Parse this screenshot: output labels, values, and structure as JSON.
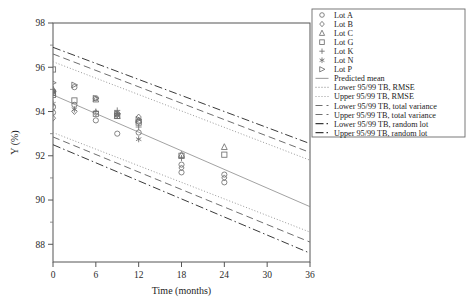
{
  "chart_data": {
    "type": "scatter",
    "title": "",
    "xlabel": "Time (months)",
    "ylabel": "Y (%)",
    "xlim": [
      0,
      36
    ],
    "ylim": [
      87.2,
      98
    ],
    "xticks": [
      0,
      6,
      12,
      18,
      24,
      30,
      36
    ],
    "yticks": [
      88,
      90,
      92,
      94,
      96,
      98
    ],
    "yminorticks": [
      89,
      91,
      93,
      95,
      97
    ],
    "grid": false,
    "legend_position": "right-outside",
    "series": [
      {
        "name": "Lot A",
        "marker": "circle",
        "points": [
          [
            0,
            94.9
          ],
          [
            0,
            94.2
          ],
          [
            0,
            93.95
          ],
          [
            3,
            95.1
          ],
          [
            3,
            94.3
          ],
          [
            6,
            94.6
          ],
          [
            6,
            93.6
          ],
          [
            9,
            93.9
          ],
          [
            9,
            93.0
          ],
          [
            12,
            93.55
          ],
          [
            12,
            93.05
          ],
          [
            18,
            91.6
          ],
          [
            18,
            91.25
          ],
          [
            24,
            91.15
          ],
          [
            24,
            90.8
          ]
        ]
      },
      {
        "name": "Lot B",
        "marker": "diamond",
        "points": [
          [
            0,
            94.95
          ],
          [
            0,
            93.7
          ],
          [
            3,
            94.0
          ],
          [
            6,
            93.95
          ],
          [
            9,
            93.85
          ],
          [
            12,
            93.75
          ],
          [
            18,
            91.45
          ],
          [
            24,
            91.0
          ]
        ]
      },
      {
        "name": "Lot C",
        "marker": "triangle-up",
        "points": [
          [
            0,
            95.0
          ],
          [
            0,
            94.85
          ],
          [
            6,
            94.55
          ],
          [
            9,
            93.8
          ],
          [
            12,
            93.6
          ],
          [
            18,
            92.05
          ],
          [
            24,
            92.4
          ]
        ]
      },
      {
        "name": "Lot G",
        "marker": "square",
        "points": [
          [
            0,
            95.9
          ],
          [
            0,
            94.85
          ],
          [
            0,
            94.75
          ],
          [
            3,
            94.5
          ],
          [
            6,
            93.9
          ],
          [
            9,
            93.8
          ],
          [
            12,
            93.5
          ],
          [
            18,
            92.0
          ],
          [
            24,
            92.05
          ]
        ]
      },
      {
        "name": "Lot K",
        "marker": "plus",
        "points": [
          [
            0,
            94.9
          ],
          [
            6,
            94.0
          ],
          [
            9,
            94.05
          ],
          [
            12,
            93.3
          ],
          [
            18,
            91.9
          ]
        ]
      },
      {
        "name": "Lot N",
        "marker": "asterisk",
        "points": [
          [
            0,
            94.35
          ],
          [
            3,
            94.1
          ],
          [
            9,
            93.85
          ],
          [
            12,
            92.75
          ]
        ]
      },
      {
        "name": "Lot P",
        "marker": "triangle-right",
        "points": [
          [
            0,
            95.3
          ],
          [
            0,
            94.9
          ],
          [
            3,
            95.2
          ],
          [
            6,
            94.6
          ],
          [
            9,
            93.9
          ],
          [
            12,
            93.65
          ]
        ]
      }
    ],
    "lines": [
      {
        "name": "Predicted mean",
        "style": "solid",
        "y0": 94.75,
        "y36": 89.7
      },
      {
        "name": "Lower 95/99 TB, RMSE",
        "style": "dotted",
        "y0": 93.05,
        "y36": 88.55
      },
      {
        "name": "Upper 95/99 TB, RMSE",
        "style": "dotted",
        "y0": 96.25,
        "y36": 91.8
      },
      {
        "name": "Lower 95/99 TB, total variance",
        "style": "dashed",
        "y0": 92.85,
        "y36": 88.1
      },
      {
        "name": "Upper 95/99 TB, total variance",
        "style": "dashed",
        "y0": 96.6,
        "y36": 92.15
      },
      {
        "name": "Lower 95/99 TB, random lot",
        "style": "dashdot",
        "y0": 92.5,
        "y36": 87.6
      },
      {
        "name": "Upper 95/99 TB, random lot",
        "style": "dashdot",
        "y0": 96.9,
        "y36": 92.55
      }
    ]
  },
  "legend": {
    "items": [
      {
        "label": "Lot A",
        "kind": "marker",
        "marker": "circle"
      },
      {
        "label": "Lot B",
        "kind": "marker",
        "marker": "diamond"
      },
      {
        "label": "Lot C",
        "kind": "marker",
        "marker": "triangle-up"
      },
      {
        "label": "Lot G",
        "kind": "marker",
        "marker": "square"
      },
      {
        "label": "Lot K",
        "kind": "marker",
        "marker": "plus"
      },
      {
        "label": "Lot N",
        "kind": "marker",
        "marker": "asterisk"
      },
      {
        "label": "Lot P",
        "kind": "marker",
        "marker": "triangle-right"
      },
      {
        "label": "Predicted mean",
        "kind": "line",
        "style": "solid"
      },
      {
        "label": "Lower 95/99 TB, RMSE",
        "kind": "line",
        "style": "dotted"
      },
      {
        "label": "Upper 95/99 TB, RMSE",
        "kind": "line",
        "style": "dotted"
      },
      {
        "label": "Lower 95/99 TB, total variance",
        "kind": "line",
        "style": "dashed"
      },
      {
        "label": "Upper 95/99 TB, total variance",
        "kind": "line",
        "style": "dashed"
      },
      {
        "label": "Lower 95/99 TB, random lot",
        "kind": "line",
        "style": "dashdot"
      },
      {
        "label": "Upper 95/99 TB, random lot",
        "kind": "line",
        "style": "dashdot"
      }
    ]
  },
  "colors": {
    "marker": "#6f6f6f",
    "fit": "#8a8a8a",
    "band_dotted": "#9a9a9a",
    "band_dashed": "#6e6e6e",
    "band_dashdot": "#3a3a3a",
    "axis": "#555555",
    "text": "#1d1d1d",
    "background": "#ffffff"
  }
}
